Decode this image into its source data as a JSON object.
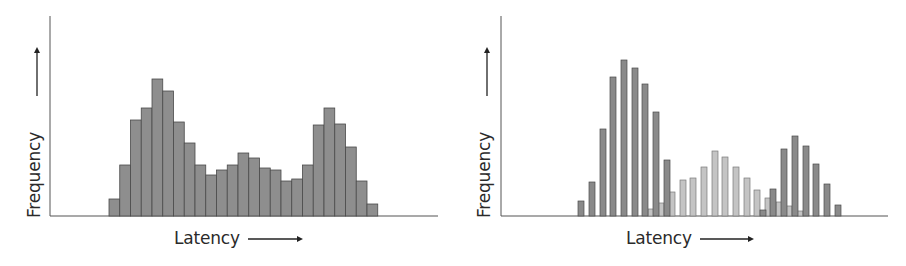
{
  "chart_data": [
    {
      "type": "bar",
      "title": "",
      "xlabel": "Latency",
      "ylabel": "Frequency",
      "axis_arrows": true,
      "ticks": false,
      "grid": false,
      "legend": null,
      "description": "Multimodal latency histogram (three modes)",
      "bar_color": "#8e8e8e",
      "bar_edge_color": "#4a4a4a",
      "ylim": [
        0,
        200
      ],
      "categories": [
        "b1",
        "b2",
        "b3",
        "b4",
        "b5",
        "b6",
        "b7",
        "b8",
        "b9",
        "b10",
        "b11",
        "b12",
        "b13",
        "b14",
        "b15",
        "b16",
        "b17",
        "b18",
        "b19",
        "b20",
        "b21",
        "b22",
        "b23",
        "b24",
        "b25"
      ],
      "values": [
        17,
        51,
        96,
        108,
        137,
        125,
        94,
        73,
        51,
        41,
        46,
        51,
        63,
        58,
        48,
        46,
        35,
        37,
        51,
        91,
        108,
        92,
        69,
        35,
        12
      ]
    },
    {
      "type": "bar",
      "title": "",
      "xlabel": "Latency",
      "ylabel": "Frequency",
      "axis_arrows": true,
      "ticks": false,
      "grid": false,
      "legend": null,
      "description": "Same latency distribution decomposed into interleaved series (outer modes dark, middle mode light)",
      "ylim": [
        0,
        200
      ],
      "series": [
        {
          "name": "dark",
          "color": "#8a8a8a",
          "edge": "#4a4a4a",
          "x": [
            581,
            592,
            603,
            613,
            624,
            635,
            645,
            656,
            667,
            763,
            773,
            784,
            795,
            806,
            816,
            827,
            838
          ],
          "values": [
            15,
            34,
            87,
            139,
            156,
            148,
            132,
            104,
            56,
            6,
            27,
            67,
            80,
            70,
            52,
            32,
            11
          ]
        },
        {
          "name": "light",
          "color": "#c4c4c4",
          "edge": "#7a7a7a",
          "x": [
            651,
            661,
            672,
            683,
            693,
            704,
            715,
            725,
            736,
            747,
            757,
            768,
            779,
            789,
            800
          ],
          "values": [
            7,
            13,
            24,
            36,
            38,
            49,
            65,
            59,
            49,
            38,
            26,
            18,
            14,
            10,
            5
          ]
        }
      ]
    }
  ],
  "labels": {
    "left": {
      "y": "Frequency",
      "x": "Latency"
    },
    "right": {
      "y": "Frequency",
      "x": "Latency"
    }
  }
}
